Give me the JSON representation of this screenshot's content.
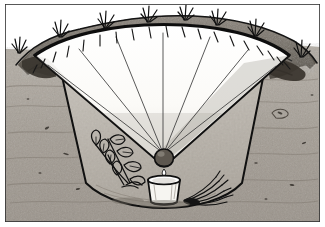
{
  "illustration": {
    "title": "Solar still cross-section",
    "medium": "pencil sketch",
    "caption": "",
    "frame": {
      "border_color": "#3a3a3a",
      "background": "#ffffff"
    },
    "palette": {
      "paper_white": "#ffffff",
      "sheet_white": "#fbfbf9",
      "sheet_shadow": "#d8d8d4",
      "soil_light": "#a9a49c",
      "soil_mid": "#8e877e",
      "soil_dark": "#6d665d",
      "mound_dark": "#5f5952",
      "ink_black": "#1b1b1b",
      "ink_grey": "#4a4a4a"
    },
    "parts": [
      {
        "name": "ground-soil-field",
        "label": "Soil / ground cross-section",
        "fill": "#a9a49c"
      },
      {
        "name": "excavated-pit",
        "label": "Excavated cone-shaped pit",
        "fill": "#bdb8b0"
      },
      {
        "name": "plastic-sheet",
        "label": "Clear plastic sheet cover",
        "fill": "#fbfbf9"
      },
      {
        "name": "sheet-fold-lines",
        "label": "Radiating fold creases on sheet",
        "count": 7
      },
      {
        "name": "sheet-edge-ticks",
        "label": "Edge hatch ticks around sheet rim",
        "count": 19
      },
      {
        "name": "center-weight-stone",
        "label": "Weight stone at sheet apex",
        "fill": "#6d665d"
      },
      {
        "name": "collection-cup",
        "label": "Water collection cup",
        "fill": "#f3f2ee"
      },
      {
        "name": "drip-droplet",
        "label": "Condensate drop falling into cup"
      },
      {
        "name": "pit-plant-left",
        "label": "Leafy green plant in pit (left)"
      },
      {
        "name": "pit-grass-right",
        "label": "Cut grass bundle in pit (right)"
      },
      {
        "name": "spoil-mound",
        "label": "Excavated soil mound on rim",
        "fill": "#6d665d"
      },
      {
        "name": "surface-grass-tufts",
        "label": "Grass tufts on ground surface",
        "count": 8
      }
    ]
  }
}
